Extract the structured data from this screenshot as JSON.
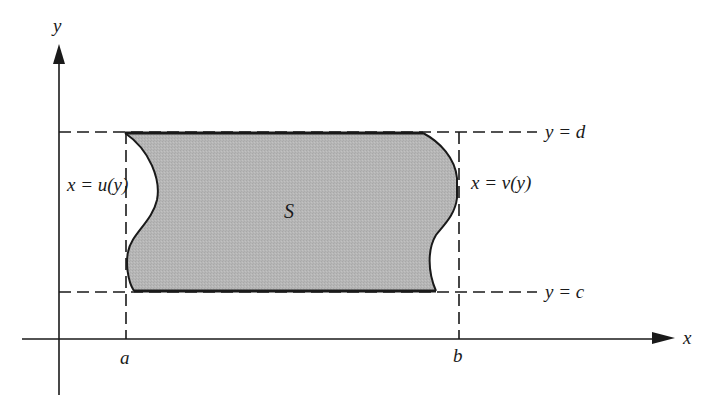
{
  "figure": {
    "axes": {
      "x_label": "x",
      "y_label": "y"
    },
    "region_label": "S",
    "left_boundary_label": "x = u(y)",
    "right_boundary_label": "x = v(y)",
    "top_line_label": "y = d",
    "bottom_line_label": "y = c",
    "x_ticks": [
      {
        "label": "a"
      },
      {
        "label": "b"
      }
    ],
    "colors": {
      "region_fill": "#b4b4b4",
      "stroke": "#1a1a1a",
      "background": "#ffffff"
    }
  }
}
